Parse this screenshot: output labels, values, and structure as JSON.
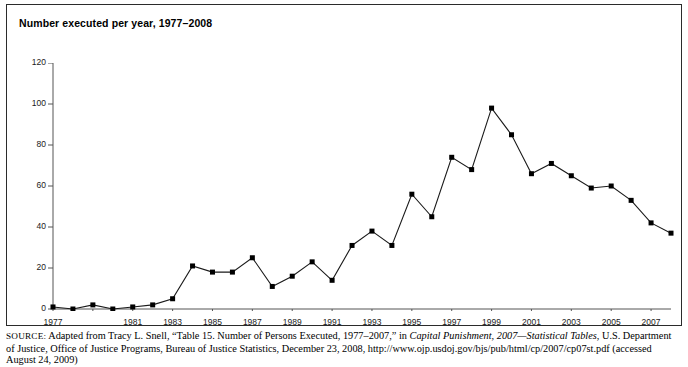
{
  "figure": {
    "title": "Number executed per year, 1977–2008"
  },
  "source": {
    "prefix": "SOURCE:",
    "line_a": " Adapted from Tracy L. Snell, “Table 15. Number of Persons Executed, 1977–2007,” in ",
    "italic_a": "Capital Punishment, 2007—Statistical Tables",
    "line_b": ", U.S. Department of Justice, Office of Justice Programs, Bureau of Justice Statistics, December 23, 2008, http://www.ojp.usdoj.gov/bjs/pub/html/cp/2007/cp07st",
    "line_c": ".pdf (accessed August 24, 2009)"
  },
  "colors": {
    "line": "#1a1a1a",
    "marker": "#000000",
    "axis": "#555555",
    "frame": "#2b2b2b",
    "background": "#ffffff"
  },
  "chart_data": {
    "type": "line",
    "title": "Number executed per year, 1977–2008",
    "xlabel": "",
    "ylabel": "",
    "ylim": [
      0,
      120
    ],
    "xlim": [
      1977,
      2008
    ],
    "ytick_values": [
      0,
      20,
      40,
      60,
      80,
      100,
      120
    ],
    "ytick_labels": [
      "0",
      "20",
      "40",
      "60",
      "80",
      "100",
      "120"
    ],
    "xtick_values": [
      1977,
      1979,
      1981,
      1983,
      1985,
      1987,
      1989,
      1991,
      1993,
      1995,
      1997,
      1999,
      2001,
      2003,
      2005,
      2007
    ],
    "xtick_labels": [
      "1977",
      "1979",
      "1981",
      "1983",
      "1985",
      "1987",
      "1989",
      "1991",
      "1993",
      "1995",
      "1997",
      "1999",
      "2001",
      "2003",
      "2005",
      "2007"
    ],
    "xtick_labels_shown": [
      "1977",
      "1981",
      "1983",
      "1985",
      "1987",
      "1989",
      "1991",
      "1993",
      "1995",
      "1997",
      "1999",
      "2001",
      "2003",
      "2005",
      "2007"
    ],
    "grid": false,
    "legend": null,
    "marker": "square",
    "x": [
      1977,
      1978,
      1979,
      1980,
      1981,
      1982,
      1983,
      1984,
      1985,
      1986,
      1987,
      1988,
      1989,
      1990,
      1991,
      1992,
      1993,
      1994,
      1995,
      1996,
      1997,
      1998,
      1999,
      2000,
      2001,
      2002,
      2003,
      2004,
      2005,
      2006,
      2007,
      2008
    ],
    "values": [
      1,
      0,
      2,
      0,
      1,
      2,
      5,
      21,
      18,
      18,
      25,
      11,
      16,
      23,
      14,
      31,
      38,
      31,
      56,
      45,
      74,
      68,
      98,
      85,
      66,
      71,
      65,
      59,
      60,
      53,
      42,
      37
    ]
  }
}
